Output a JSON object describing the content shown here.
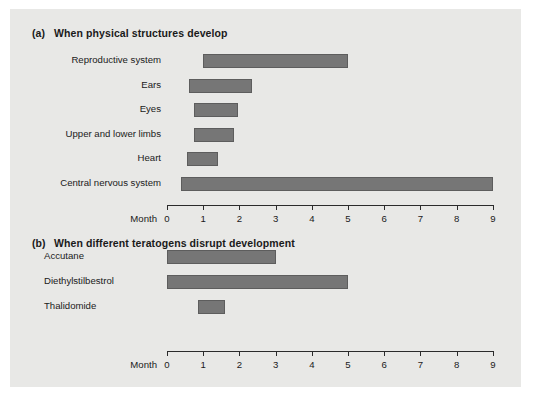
{
  "figure": {
    "background_color": "#e8e8e6",
    "bar_color": "#767676",
    "axis_color": "#2b2b2b",
    "text_color": "#1a1a1a"
  },
  "panels": [
    {
      "tag": "(a)",
      "title": "When physical structures develop",
      "axis_title": "Month"
    },
    {
      "tag": "(b)",
      "title": "When different teratogens disrupt development",
      "axis_title": "Month"
    }
  ],
  "axis": {
    "ticks": [
      "0",
      "1",
      "2",
      "3",
      "4",
      "5",
      "6",
      "7",
      "8",
      "9"
    ],
    "title": "Month",
    "min": 0,
    "max": 9
  },
  "chart_data": [
    {
      "type": "bar",
      "orientation": "horizontal",
      "subtype": "gantt-range",
      "title": "When physical structures develop",
      "panel_tag": "(a)",
      "xlabel": "Month",
      "ylabel": "",
      "xlim": [
        0,
        9
      ],
      "xticks": [
        0,
        1,
        2,
        3,
        4,
        5,
        6,
        7,
        8,
        9
      ],
      "grid": false,
      "legend": "none",
      "categories": [
        "Reproductive system",
        "Ears",
        "Eyes",
        "Upper and lower limbs",
        "Heart",
        "Central nervous\nsystem"
      ],
      "ranges": [
        {
          "label": "Reproductive system",
          "start": 1.0,
          "end": 5.0
        },
        {
          "label": "Ears",
          "start": 0.6,
          "end": 2.35
        },
        {
          "label": "Eyes",
          "start": 0.75,
          "end": 1.95
        },
        {
          "label": "Upper and lower limbs",
          "start": 0.75,
          "end": 1.85
        },
        {
          "label": "Heart",
          "start": 0.55,
          "end": 1.4
        },
        {
          "label": "Central nervous system",
          "start": 0.4,
          "end": 9.0
        }
      ]
    },
    {
      "type": "bar",
      "orientation": "horizontal",
      "subtype": "gantt-range",
      "title": "When different teratogens disrupt development",
      "panel_tag": "(b)",
      "xlabel": "Month",
      "ylabel": "",
      "xlim": [
        0,
        9
      ],
      "xticks": [
        0,
        1,
        2,
        3,
        4,
        5,
        6,
        7,
        8,
        9
      ],
      "grid": false,
      "legend": "none",
      "categories": [
        "Accutane",
        "Diethylstilbestrol",
        "Thalidomide"
      ],
      "ranges": [
        {
          "label": "Accutane",
          "start": 0.0,
          "end": 3.0
        },
        {
          "label": "Diethylstilbestrol",
          "start": 0.0,
          "end": 5.0
        },
        {
          "label": "Thalidomide",
          "start": 0.85,
          "end": 1.6
        }
      ]
    }
  ]
}
